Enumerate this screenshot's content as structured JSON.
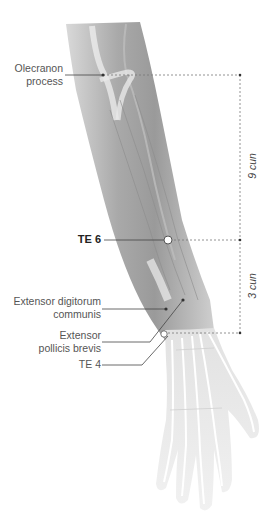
{
  "diagram": {
    "labels": {
      "olecranon_line1": "Olecranon",
      "olecranon_line2": "process",
      "te6": "TE 6",
      "edc_line1": "Extensor digitorum",
      "edc_line2": "communis",
      "epb_line1": "Extensor",
      "epb_line2": "pollicis brevis",
      "te4": "TE 4"
    },
    "measurements": {
      "upper": "9 cun",
      "lower": "3 cun"
    },
    "colors": {
      "muscle": "#9a9a9a",
      "muscle_light": "#cfcfcf",
      "bone": "#e8e8e8",
      "leader": "#444444",
      "dashed": "#777777"
    }
  }
}
